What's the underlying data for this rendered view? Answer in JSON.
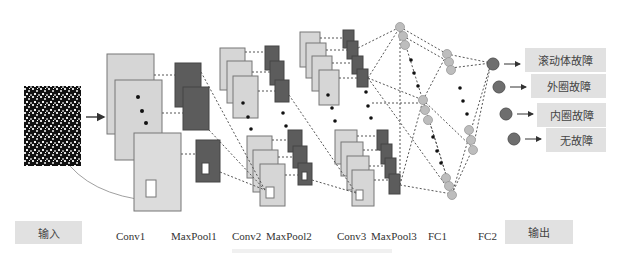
{
  "input_label": "输入",
  "output_label": "输出",
  "layers": [
    {
      "id": "conv1",
      "label": "Conv1",
      "x": 117
    },
    {
      "id": "maxpool1",
      "label": "MaxPool1",
      "x": 172
    },
    {
      "id": "conv2",
      "label": "Conv2",
      "x": 233
    },
    {
      "id": "maxpool2",
      "label": "MaxPool2",
      "x": 266
    },
    {
      "id": "conv3",
      "label": "Conv3",
      "x": 338
    },
    {
      "id": "maxpool3",
      "label": "MaxPool3",
      "x": 371
    },
    {
      "id": "fc1",
      "label": "FC1",
      "x": 428
    },
    {
      "id": "fc2",
      "label": "FC2",
      "x": 478
    }
  ],
  "outputs": [
    {
      "label": "滚动体故障",
      "y": 49
    },
    {
      "label": "外圈故障",
      "y": 75
    },
    {
      "label": "内圈故障",
      "y": 104
    },
    {
      "label": "无故障",
      "y": 129
    }
  ],
  "colors": {
    "feature_map": "#d4d4d4",
    "pool_map": "#5a5a5a",
    "node_light": "#b8b8b8",
    "node_dark": "#6a6a6a",
    "label_box": "#e1e1e1"
  }
}
